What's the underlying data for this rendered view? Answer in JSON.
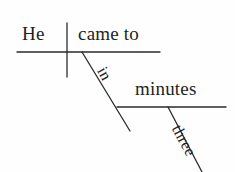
{
  "diagram": {
    "type": "reed-kellogg-sentence-diagram",
    "sentence": "He came to in three minutes.",
    "background_color": "#fefefe",
    "ink_color": "#1f1f1f",
    "words": {
      "subject": "He",
      "verb": "came to",
      "preposition": "in",
      "object_of_preposition": "minutes",
      "modifier": "three"
    },
    "lines": {
      "main_baseline": {
        "x1": 17,
        "y1": 52,
        "x2": 160,
        "y2": 52
      },
      "subject_verb_divider": {
        "x1": 67,
        "y1": 23,
        "x2": 67,
        "y2": 77
      },
      "preposition_slant": {
        "x1": 82,
        "y1": 52,
        "x2": 130,
        "y2": 131
      },
      "prepositional_baseline": {
        "x1": 117,
        "y1": 107,
        "x2": 226,
        "y2": 107
      },
      "modifier_slant": {
        "x1": 168,
        "y1": 107,
        "x2": 202,
        "y2": 172
      }
    }
  }
}
